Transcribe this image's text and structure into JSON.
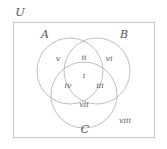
{
  "diagram": {
    "universe": {
      "label": "U",
      "x": 20,
      "y": 13
    },
    "frame": {
      "x": 13.5,
      "y": 22.5,
      "width": 141,
      "height": 115,
      "stroke": "#c9c9c9"
    },
    "sets": [
      {
        "name": "set-a",
        "label": "A",
        "cx": 70,
        "cy": 71,
        "r": 33,
        "label_x": 45,
        "label_y": 34
      },
      {
        "name": "set-b",
        "label": "B",
        "cx": 97,
        "cy": 71,
        "r": 33,
        "label_x": 124,
        "label_y": 34
      },
      {
        "name": "set-c",
        "label": "C",
        "cx": 84,
        "cy": 95,
        "r": 33,
        "label_x": 85,
        "label_y": 129
      }
    ],
    "circle_stroke": "#b5b5b5",
    "regions": [
      {
        "name": "region-center-abc",
        "label": "i",
        "x": 84,
        "y": 76
      },
      {
        "name": "region-ab",
        "label": "ii",
        "x": 84,
        "y": 58
      },
      {
        "name": "region-bc",
        "label": "iii",
        "x": 100,
        "y": 86
      },
      {
        "name": "region-ac",
        "label": "iv",
        "x": 68,
        "y": 86
      },
      {
        "name": "region-a-only",
        "label": "v",
        "x": 58,
        "y": 59
      },
      {
        "name": "region-b-only",
        "label": "vi",
        "x": 109,
        "y": 59
      },
      {
        "name": "region-c-only",
        "label": "vii",
        "x": 84,
        "y": 105
      },
      {
        "name": "region-outside",
        "label": "viii",
        "x": 125,
        "y": 121
      }
    ]
  }
}
